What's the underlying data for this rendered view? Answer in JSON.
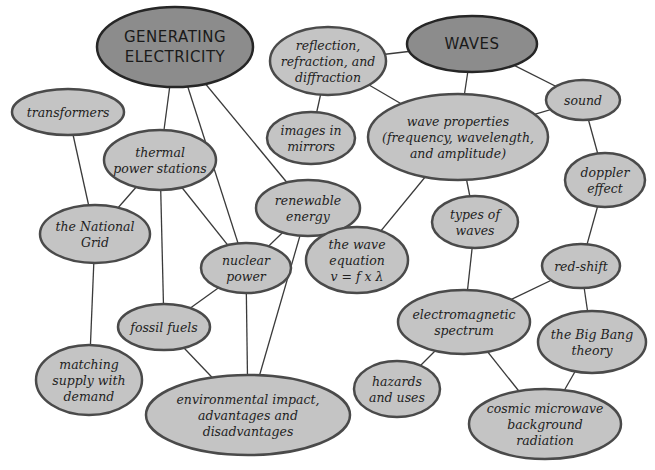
{
  "colors": {
    "main_node_fill": "#8c8c8c",
    "node_fill": "#c4c4c4",
    "node_stroke": "#4a4a4a",
    "edge": "#3a3a3a",
    "background": "#ffffff"
  },
  "nodes": [
    {
      "id": "generating-electricity",
      "type": "main",
      "lines": [
        "GENERATING",
        "ELECTRICITY"
      ]
    },
    {
      "id": "waves",
      "type": "main",
      "lines": [
        "WAVES"
      ]
    },
    {
      "id": "reflection",
      "type": "sub",
      "lines": [
        "reflection,",
        "refraction, and",
        "diffraction"
      ]
    },
    {
      "id": "transformers",
      "type": "sub",
      "lines": [
        "transformers"
      ]
    },
    {
      "id": "thermal",
      "type": "sub",
      "lines": [
        "thermal",
        "power stations"
      ]
    },
    {
      "id": "images-in-mirrors",
      "type": "sub",
      "lines": [
        "images in",
        "mirrors"
      ]
    },
    {
      "id": "wave-properties",
      "type": "sub",
      "lines": [
        "wave properties",
        "(frequency, wavelength,",
        "and amplitude)"
      ]
    },
    {
      "id": "sound",
      "type": "sub",
      "lines": [
        "sound"
      ]
    },
    {
      "id": "renewable",
      "type": "sub",
      "lines": [
        "renewable",
        "energy"
      ]
    },
    {
      "id": "national-grid",
      "type": "sub",
      "lines": [
        "the National",
        "Grid"
      ]
    },
    {
      "id": "doppler",
      "type": "sub",
      "lines": [
        "doppler",
        "effect"
      ]
    },
    {
      "id": "nuclear",
      "type": "sub",
      "lines": [
        "nuclear",
        "power"
      ]
    },
    {
      "id": "types-of-waves",
      "type": "sub",
      "lines": [
        "types of",
        "waves"
      ]
    },
    {
      "id": "wave-equation",
      "type": "sub",
      "lines": [
        "the wave",
        "equation",
        "v = f x λ"
      ]
    },
    {
      "id": "red-shift",
      "type": "sub",
      "lines": [
        "red-shift"
      ]
    },
    {
      "id": "fossil-fuels",
      "type": "sub",
      "lines": [
        "fossil fuels"
      ]
    },
    {
      "id": "em-spectrum",
      "type": "sub",
      "lines": [
        "electromagnetic",
        "spectrum"
      ]
    },
    {
      "id": "big-bang",
      "type": "sub",
      "lines": [
        "the Big Bang",
        "theory"
      ]
    },
    {
      "id": "matching-supply",
      "type": "sub",
      "lines": [
        "matching",
        "supply with",
        "demand"
      ]
    },
    {
      "id": "hazards",
      "type": "sub",
      "lines": [
        "hazards",
        "and uses"
      ]
    },
    {
      "id": "environmental",
      "type": "sub",
      "lines": [
        "environmental impact,",
        "advantages and",
        "disadvantages"
      ]
    },
    {
      "id": "cmbr",
      "type": "sub",
      "lines": [
        "cosmic microwave",
        "background",
        "radiation"
      ]
    }
  ],
  "edges": [
    [
      "generating-electricity",
      "thermal"
    ],
    [
      "generating-electricity",
      "nuclear"
    ],
    [
      "generating-electricity",
      "renewable"
    ],
    [
      "transformers",
      "national-grid"
    ],
    [
      "thermal",
      "national-grid"
    ],
    [
      "thermal",
      "fossil-fuels"
    ],
    [
      "thermal",
      "nuclear"
    ],
    [
      "national-grid",
      "matching-supply"
    ],
    [
      "renewable",
      "nuclear"
    ],
    [
      "renewable",
      "environmental"
    ],
    [
      "nuclear",
      "fossil-fuels"
    ],
    [
      "nuclear",
      "environmental"
    ],
    [
      "fossil-fuels",
      "environmental"
    ],
    [
      "waves",
      "reflection"
    ],
    [
      "waves",
      "wave-properties"
    ],
    [
      "waves",
      "sound"
    ],
    [
      "reflection",
      "images-in-mirrors"
    ],
    [
      "reflection",
      "wave-properties"
    ],
    [
      "wave-properties",
      "sound"
    ],
    [
      "wave-properties",
      "wave-equation"
    ],
    [
      "wave-properties",
      "types-of-waves"
    ],
    [
      "sound",
      "doppler"
    ],
    [
      "doppler",
      "red-shift"
    ],
    [
      "types-of-waves",
      "em-spectrum"
    ],
    [
      "red-shift",
      "em-spectrum"
    ],
    [
      "red-shift",
      "big-bang"
    ],
    [
      "em-spectrum",
      "hazards"
    ],
    [
      "em-spectrum",
      "cmbr"
    ],
    [
      "big-bang",
      "cmbr"
    ]
  ]
}
